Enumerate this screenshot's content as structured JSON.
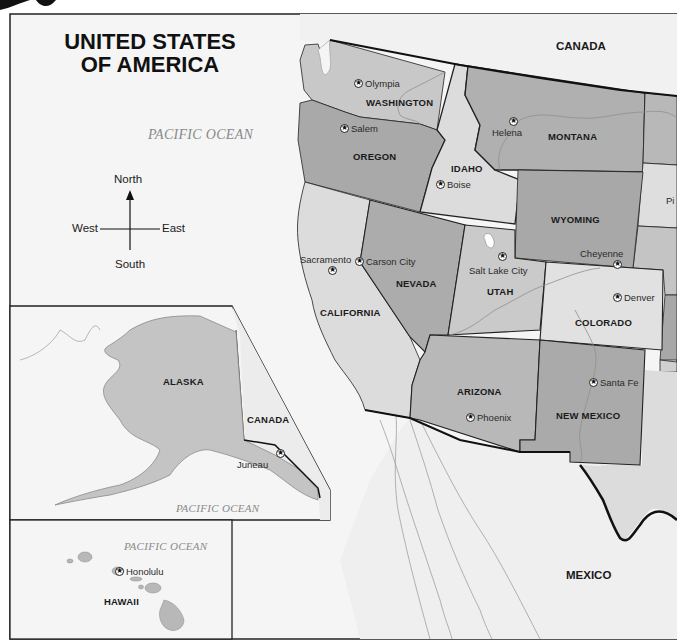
{
  "title": {
    "line1": "UNITED STATES",
    "line2": "OF AMERICA"
  },
  "oceans": {
    "main": "PACIFIC OCEAN",
    "alaska_inset": "PACIFIC OCEAN",
    "hawaii_inset": "PACIFIC OCEAN"
  },
  "countries": {
    "canada_main": "CANADA",
    "canada_inset": "CANADA",
    "mexico": "MEXICO"
  },
  "compass": {
    "north": "North",
    "south": "South",
    "east": "East",
    "west": "West"
  },
  "states": [
    {
      "name": "WASHINGTON",
      "capital": "Olympia"
    },
    {
      "name": "OREGON",
      "capital": "Salem"
    },
    {
      "name": "IDAHO",
      "capital": "Boise"
    },
    {
      "name": "MONTANA",
      "capital": "Helena"
    },
    {
      "name": "WYOMING",
      "capital": "Cheyenne"
    },
    {
      "name": "CALIFORNIA",
      "capital": "Sacramento"
    },
    {
      "name": "NEVADA",
      "capital": "Carson City"
    },
    {
      "name": "UTAH",
      "capital": "Salt Lake City"
    },
    {
      "name": "COLORADO",
      "capital": "Denver"
    },
    {
      "name": "ARIZONA",
      "capital": "Phoenix"
    },
    {
      "name": "NEW MEXICO",
      "capital": "Santa Fe"
    },
    {
      "name": "ALASKA",
      "capital": "Juneau"
    },
    {
      "name": "HAWAII",
      "capital": "Honolulu"
    }
  ],
  "partial_labels": {
    "pierre_fragment": "Pi"
  },
  "colors": {
    "ocean_bg": "#f4f4f4",
    "state_light": "#dedede",
    "state_mid": "#c6c6c6",
    "state_dark": "#a8a8a8",
    "neighbor_land": "#ececec",
    "border": "#111111",
    "river": "#9a9a9a"
  }
}
